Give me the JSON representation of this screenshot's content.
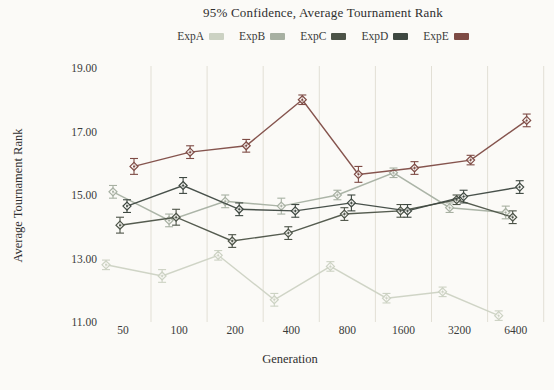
{
  "title": "95% Confidence, Average Tournament Rank",
  "x_axis_title": "Generation",
  "y_axis_title": "Average Tournament Rank",
  "chart_data": {
    "type": "line",
    "title": "95% Confidence, Average Tournament Rank",
    "xlabel": "Generation",
    "ylabel": "Average Tournament Rank",
    "x_scale": "log2",
    "categories": [
      50,
      100,
      200,
      400,
      800,
      1600,
      3200,
      6400
    ],
    "x_tick_labels": [
      "50",
      "100",
      "200",
      "400",
      "800",
      "1600",
      "3200",
      "6400"
    ],
    "y_ticks": [
      11,
      13,
      15,
      17,
      19
    ],
    "y_tick_labels": [
      "11.00",
      "13.00",
      "15.00",
      "17.00",
      "19.00"
    ],
    "ylim": [
      11,
      19
    ],
    "grid": "vertical-minor-only",
    "error_bars": "95% confidence intervals",
    "legend_position": "top",
    "marker": "open-diamond",
    "series": [
      {
        "name": "ExpA",
        "color": "#ccd2c3",
        "values": [
          12.8,
          12.45,
          13.1,
          11.7,
          12.75,
          11.75,
          11.95,
          11.2
        ],
        "errors": [
          0.15,
          0.2,
          0.15,
          0.2,
          0.15,
          0.15,
          0.15,
          0.15
        ]
      },
      {
        "name": "ExpB",
        "color": "#a7b0a2",
        "values": [
          15.1,
          14.2,
          14.8,
          14.65,
          15.0,
          15.7,
          14.6,
          14.45
        ],
        "errors": [
          0.2,
          0.2,
          0.2,
          0.25,
          0.15,
          0.15,
          0.15,
          0.2
        ]
      },
      {
        "name": "ExpC",
        "color": "#4c5347",
        "values": [
          14.05,
          14.3,
          13.55,
          13.8,
          14.4,
          14.5,
          14.85,
          14.3
        ],
        "errors": [
          0.25,
          0.25,
          0.2,
          0.2,
          0.2,
          0.2,
          0.15,
          0.2
        ]
      },
      {
        "name": "ExpD",
        "color": "#3e4841",
        "values": [
          14.65,
          15.3,
          14.55,
          14.5,
          14.75,
          14.5,
          14.95,
          15.25
        ],
        "errors": [
          0.2,
          0.25,
          0.2,
          0.2,
          0.25,
          0.2,
          0.2,
          0.2
        ]
      },
      {
        "name": "ExpE",
        "color": "#7e4b45",
        "values": [
          15.9,
          16.35,
          16.55,
          18.0,
          15.65,
          15.85,
          16.1,
          17.35
        ],
        "errors": [
          0.25,
          0.2,
          0.2,
          0.15,
          0.25,
          0.2,
          0.15,
          0.2
        ]
      }
    ]
  }
}
